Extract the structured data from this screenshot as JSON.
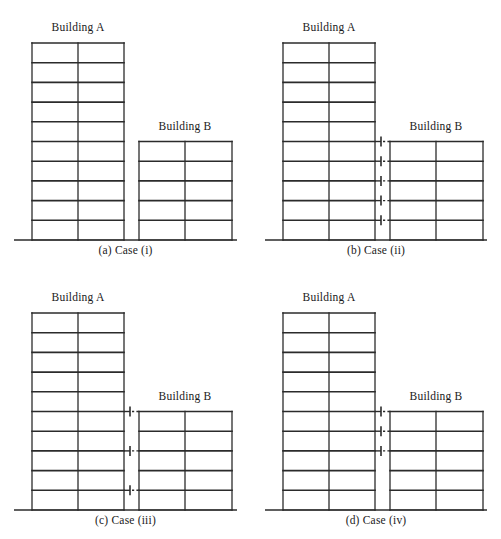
{
  "figure": {
    "background": "#ffffff",
    "line_color": "#2b2b2b",
    "panels": [
      {
        "caption": "(a) Case (i)",
        "label_a": "Building A",
        "label_b": "Building B",
        "links": []
      },
      {
        "caption": "(b) Case (ii)",
        "label_a": "Building A",
        "label_b": "Building B",
        "links": [
          1,
          2,
          3,
          4,
          5
        ]
      },
      {
        "caption": "(c) Case (iii)",
        "label_a": "Building A",
        "label_b": "Building B",
        "links": [
          1,
          3,
          5
        ]
      },
      {
        "caption": "(d) Case (iv)",
        "label_a": "Building A",
        "label_b": "Building B",
        "links": [
          3,
          4,
          5
        ]
      }
    ]
  },
  "chart_data": {
    "type": "diagram",
    "subtitle": "",
    "xlabel": "",
    "ylabel": "",
    "structures": [
      {
        "name": "Building A",
        "stories": 10,
        "bays": 2,
        "relative_height": 1.0,
        "description": "Taller ten-storey two-bay frame on the left of each panel"
      },
      {
        "name": "Building B",
        "stories": 5,
        "bays": 2,
        "relative_height": 0.5,
        "description": "Shorter five-storey two-bay frame on the right; floor levels align with the lower five floors of Building A"
      }
    ],
    "link_levels_by_case": {
      "Case (i)": [],
      "Case (ii)": [
        1,
        2,
        3,
        4,
        5
      ],
      "Case (iii)": [
        1,
        3,
        5
      ],
      "Case (iv)": [
        3,
        4,
        5
      ]
    },
    "link_counts": [
      0,
      5,
      3,
      3
    ],
    "link_element": "dashed damper link with bar end-caps spanning the gap between Building A and Building B at a floor level",
    "categories": [
      "(a) Case (i)",
      "(b) Case (ii)",
      "(c) Case (iii)",
      "(d) Case (iv)"
    ],
    "values": [
      0,
      5,
      3,
      3
    ],
    "legend": [],
    "annotations": [
      "Case (i): buildings uncoupled, no dampers",
      "Case (ii): dampers at all five Building B floor levels",
      "Case (iii): dampers at alternate levels 1, 3 and 5",
      "Case (iv): dampers at the upper three levels 3, 4 and 5"
    ],
    "grid": false
  }
}
